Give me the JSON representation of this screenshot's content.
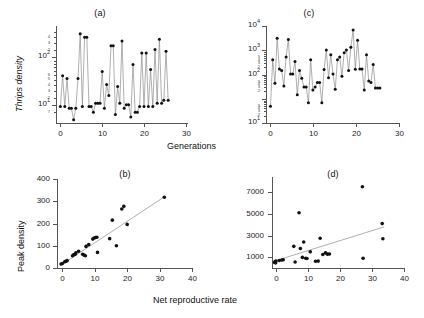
{
  "figure": {
    "width": 424,
    "height": 318,
    "background": "#ffffff",
    "marker_color": "#111111",
    "line_color": "#8d8d8d",
    "axis_color": "#555555"
  },
  "axis_titles": {
    "thrips_density": "Thrips density",
    "generations": "Generations",
    "peak_density": "Peak density",
    "net_reproductive_rate": "Net reproductive rate"
  },
  "chart_data": [
    {
      "id": "panel-a",
      "type": "line",
      "title": "(a)",
      "xlabel": "Generations",
      "ylabel": "Thrips density",
      "yscale": "log",
      "xlim": [
        0,
        30
      ],
      "ylim": [
        7,
        400
      ],
      "xticks": [
        0,
        10,
        20,
        30
      ],
      "xticklabels": [
        "0",
        "10",
        "20",
        "30"
      ],
      "yticks": [
        10,
        100
      ],
      "yticklabels": [
        "10",
        "100"
      ],
      "yticklabels_display": [
        "10^1",
        "10^2"
      ],
      "yminorticks": [
        7,
        8,
        9,
        20,
        30,
        40,
        50,
        60,
        70,
        80,
        90,
        200,
        300,
        400
      ],
      "yminorlabels": [
        "7",
        "8",
        "9",
        "2",
        "3",
        "4",
        "5",
        "6",
        "7",
        "8",
        "9",
        "2",
        "3",
        "4"
      ],
      "grid": false,
      "legend": null,
      "x": [
        1,
        1.5,
        2,
        2.5,
        3,
        3.5,
        4,
        4.5,
        5,
        5.5,
        6,
        6.5,
        7,
        7.5,
        8,
        8.5,
        9,
        9.5,
        10,
        10.5,
        11,
        11.5,
        12,
        12.5,
        13,
        13.5,
        14,
        14.5,
        15,
        15.5,
        16,
        16.5,
        17,
        17.5,
        18,
        18.5,
        19,
        19.5,
        20,
        20.5,
        21,
        21.5,
        22,
        22.5,
        23,
        23.5,
        24,
        24.5,
        25,
        25.5
      ],
      "y": [
        14,
        50,
        14,
        45,
        13,
        13,
        8,
        13,
        45,
        290,
        14,
        250,
        250,
        14,
        14,
        11,
        16,
        16,
        16,
        60,
        13,
        35,
        22,
        175,
        175,
        10,
        32,
        16,
        215,
        13,
        15,
        15,
        9,
        80,
        11,
        11,
        14,
        130,
        14,
        130,
        14,
        65,
        14,
        150,
        16,
        230,
        16,
        18,
        140,
        18
      ]
    },
    {
      "id": "panel-c",
      "type": "line",
      "title": "(c)",
      "xlabel": "Generations",
      "ylabel": "Thrips density",
      "yscale": "log",
      "xlim": [
        0,
        30
      ],
      "ylim": [
        10,
        10000
      ],
      "xticks": [
        0,
        10,
        20,
        30
      ],
      "xticklabels": [
        "0",
        "10",
        "20",
        "30"
      ],
      "yticks": [
        10,
        100,
        1000,
        10000
      ],
      "yticklabels_display": [
        "10^1",
        "10^2",
        "10^3",
        "10^4"
      ],
      "yminorlabels": [
        "2",
        "3",
        "4",
        "5",
        "2",
        "3",
        "4",
        "5",
        "2",
        "3",
        "4",
        "5"
      ],
      "grid": false,
      "legend": null,
      "x": [
        1,
        1.5,
        2,
        2.5,
        3,
        3.5,
        4,
        4.5,
        5,
        5.5,
        6,
        6.5,
        7,
        7.5,
        8,
        8.5,
        9,
        9.5,
        10,
        10.5,
        11,
        11.5,
        12,
        12.5,
        13,
        13.5,
        14,
        14.5,
        15,
        15.5,
        16,
        16.5,
        17,
        17.5,
        18,
        18.5,
        19,
        19.5,
        20,
        20.5,
        21,
        21.5,
        22,
        22.5,
        23,
        23.5,
        24,
        24.5,
        25,
        25.5
      ],
      "y": [
        33,
        900,
        170,
        4200,
        470,
        420,
        140,
        1100,
        3800,
        330,
        330,
        800,
        75,
        420,
        240,
        130,
        130,
        42,
        900,
        105,
        130,
        180,
        180,
        42,
        450,
        1800,
        250,
        1300,
        330,
        110,
        900,
        1100,
        280,
        1500,
        1800,
        420,
        2200,
        7500,
        460,
        3600,
        470,
        470,
        105,
        1300,
        200,
        180,
        650,
        120,
        120,
        120
      ]
    },
    {
      "id": "panel-b",
      "type": "scatter",
      "title": "(b)",
      "xlabel": "Net reproductive rate",
      "ylabel": "Peak density",
      "xlim": [
        0,
        40
      ],
      "ylim": [
        0,
        400
      ],
      "xticks": [
        0,
        10,
        20,
        30,
        40
      ],
      "xticklabels": [
        "0",
        "10",
        "20",
        "30",
        "40"
      ],
      "yticks": [
        0,
        100,
        200,
        300,
        400
      ],
      "yticklabels": [
        "0",
        "100",
        "200",
        "300",
        "400"
      ],
      "grid": false,
      "legend": null,
      "points": [
        [
          1.2,
          18
        ],
        [
          1.6,
          20
        ],
        [
          2.3,
          28
        ],
        [
          2.6,
          30
        ],
        [
          3.0,
          33
        ],
        [
          4.6,
          55
        ],
        [
          5.0,
          60
        ],
        [
          5.4,
          62
        ],
        [
          5.6,
          68
        ],
        [
          6.4,
          75
        ],
        [
          7.6,
          62
        ],
        [
          8.0,
          58
        ],
        [
          8.4,
          55
        ],
        [
          8.6,
          97
        ],
        [
          9.4,
          105
        ],
        [
          10.6,
          130
        ],
        [
          11.0,
          135
        ],
        [
          11.4,
          137
        ],
        [
          11.8,
          138
        ],
        [
          12.0,
          70
        ],
        [
          15.6,
          132
        ],
        [
          16.4,
          215
        ],
        [
          17.6,
          100
        ],
        [
          19.2,
          265
        ],
        [
          19.8,
          277
        ],
        [
          20.8,
          196
        ],
        [
          31.8,
          318
        ]
      ],
      "fit_line": {
        "x": [
          0.9,
          31.8
        ],
        "y": [
          10,
          320
        ]
      }
    },
    {
      "id": "panel-d",
      "type": "scatter",
      "title": "(d)",
      "xlabel": "Net reproductive rate",
      "ylabel": "Peak density",
      "xlim": [
        0,
        40
      ],
      "ylim": [
        0,
        8400
      ],
      "xticks": [
        0,
        10,
        20,
        30,
        40
      ],
      "xticklabels": [
        "0",
        "10",
        "20",
        "30",
        "40"
      ],
      "yticks": [
        1000,
        3000,
        5000,
        7000
      ],
      "yticklabels": [
        "1000",
        "3000",
        "5000",
        "7000"
      ],
      "grid": false,
      "legend": null,
      "points": [
        [
          0.8,
          520
        ],
        [
          0.9,
          560
        ],
        [
          1.0,
          600
        ],
        [
          1.1,
          480
        ],
        [
          1.2,
          640
        ],
        [
          2.2,
          700
        ],
        [
          3.0,
          740
        ],
        [
          3.4,
          760
        ],
        [
          6.6,
          2000
        ],
        [
          7.0,
          560
        ],
        [
          8.2,
          5100
        ],
        [
          8.6,
          1800
        ],
        [
          9.2,
          980
        ],
        [
          9.6,
          2400
        ],
        [
          10.2,
          900
        ],
        [
          10.6,
          880
        ],
        [
          11.6,
          1500
        ],
        [
          13.2,
          620
        ],
        [
          14.0,
          640
        ],
        [
          14.6,
          2750
        ],
        [
          15.4,
          1250
        ],
        [
          16.2,
          1400
        ],
        [
          16.8,
          1280
        ],
        [
          17.4,
          1300
        ],
        [
          27.4,
          7500
        ],
        [
          27.6,
          900
        ],
        [
          33.4,
          4100
        ],
        [
          33.6,
          2700
        ]
      ],
      "fit_line": {
        "x": [
          0.5,
          34.0
        ],
        "y": [
          620,
          3800
        ]
      }
    }
  ]
}
